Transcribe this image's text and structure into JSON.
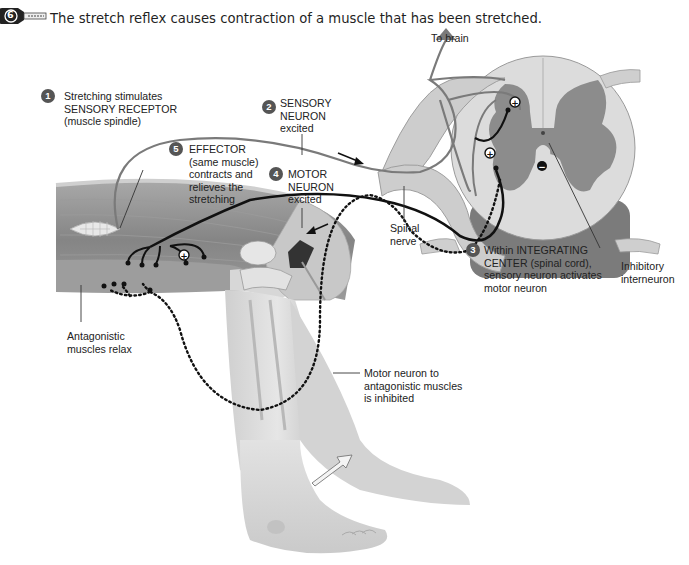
{
  "header": {
    "icon": "key-icon",
    "icon_number": "6",
    "caption": "The stretch reflex causes contraction of a muscle that has been stretched."
  },
  "steps": [
    {
      "number": "1",
      "lines": [
        "Stretching stimulates",
        "SENSORY RECEPTOR",
        "(muscle spindle)"
      ]
    },
    {
      "number": "2",
      "lines": [
        "SENSORY",
        "NEURON",
        "excited"
      ]
    },
    {
      "number": "3",
      "lines": [
        "Within INTEGRATING",
        "CENTER (spinal cord),",
        "sensory neuron activates",
        "motor neuron"
      ]
    },
    {
      "number": "4",
      "lines": [
        "MOTOR",
        "NEURON",
        "excited"
      ]
    },
    {
      "number": "5",
      "lines": [
        "EFFECTOR",
        "(same muscle)",
        "contracts and",
        "relieves the",
        "stretching"
      ]
    }
  ],
  "labels": {
    "to_brain": "To brain",
    "spinal_nerve": [
      "Spinal",
      "nerve"
    ],
    "inhibitory_interneuron": [
      "Inhibitory",
      "interneuron"
    ],
    "antagonistic_relax": [
      "Antagonistic",
      "muscles relax"
    ],
    "motor_inhibited": [
      "Motor neuron to",
      "antagonistic muscles",
      "is inhibited"
    ]
  },
  "symbols": {
    "plus": "+",
    "minus": "−"
  },
  "colors": {
    "sensory_neuron": "#7a7a7a",
    "motor_neuron": "#111111",
    "gray_matter": "#8c8c8c",
    "white_matter": "#d9d9d9",
    "muscle": "#8a8a8a",
    "skin": "#dcdcdc",
    "step_badge": "#555555"
  }
}
